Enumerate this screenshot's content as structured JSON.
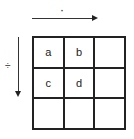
{
  "diagram": {
    "top_operator": "·",
    "left_operator": "÷",
    "grid": {
      "rows": 3,
      "cols": 3,
      "cells": [
        [
          "a",
          "b",
          ""
        ],
        [
          "c",
          "d",
          ""
        ],
        [
          "",
          "",
          ""
        ]
      ]
    },
    "colors": {
      "line": "#222222",
      "background": "#ffffff"
    }
  }
}
